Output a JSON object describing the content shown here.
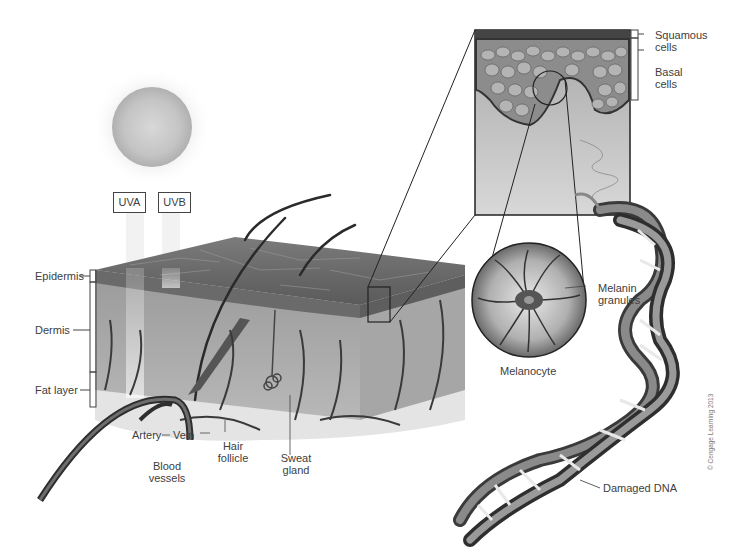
{
  "diagram": {
    "sun": {
      "icon": "sun-icon"
    },
    "uv_labels": [
      "UVA",
      "UVB"
    ],
    "skin_layers": [
      "Epidermis",
      "Dermis",
      "Fat layer"
    ],
    "skin_structures": {
      "artery": "Artery",
      "vein": "Vein",
      "blood_vessels": [
        "Blood",
        "vessels"
      ],
      "hair_follicle": [
        "Hair",
        "follicle"
      ],
      "sweat_gland": [
        "Sweat",
        "gland"
      ]
    },
    "inset_labels": {
      "squamous": [
        "Squamous",
        "cells"
      ],
      "basal": [
        "Basal",
        "cells"
      ]
    },
    "melanocyte": {
      "title": "Melanocyte",
      "granules": [
        "Melanin",
        "granules"
      ]
    },
    "dna": {
      "label": "Damaged DNA"
    },
    "copyright": "© Cengage Learning 2013"
  }
}
